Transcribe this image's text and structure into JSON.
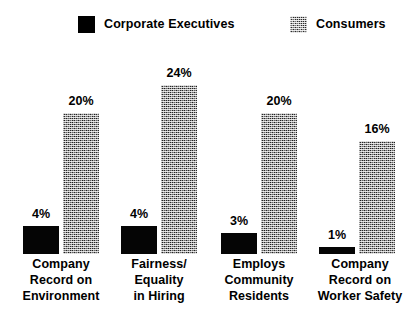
{
  "legend": {
    "items": [
      {
        "label": "Corporate Executives",
        "swatch": "solid-black-swatch-icon",
        "color": "#000000"
      },
      {
        "label": "Consumers",
        "swatch": "dithered-gray-swatch-icon",
        "color": "#2a2a2a"
      }
    ]
  },
  "chart_data": {
    "type": "bar",
    "title": "",
    "subtitle": "",
    "xlabel": "",
    "ylabel": "",
    "ylim": [
      0,
      26
    ],
    "grid": false,
    "legend_position": "top",
    "value_format": "percent",
    "categories": [
      "Company Record on Environment",
      "Fairness/ Equality in Hiring",
      "Employs Community Residents",
      "Company Record on Worker Safety"
    ],
    "category_lines": [
      [
        "Company",
        "Record on",
        "Environment"
      ],
      [
        "Fairness/",
        "Equality",
        "in Hiring"
      ],
      [
        "Employs",
        "Community",
        "Residents"
      ],
      [
        "Company",
        "Record on",
        "Worker Safety"
      ]
    ],
    "series": [
      {
        "name": "Corporate Executives",
        "values": [
          4,
          4,
          3,
          1
        ],
        "labels": [
          "4%",
          "4%",
          "3%",
          "1%"
        ],
        "color": "#000000",
        "fill": "solid"
      },
      {
        "name": "Consumers",
        "values": [
          20,
          24,
          20,
          16
        ],
        "labels": [
          "20%",
          "24%",
          "20%",
          "16%"
        ],
        "color": "#2a2a2a",
        "fill": "dither"
      }
    ]
  }
}
